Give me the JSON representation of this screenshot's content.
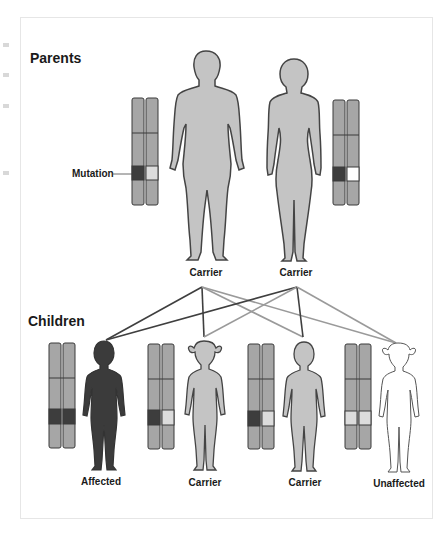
{
  "figure": {
    "sections": {
      "parents": "Parents",
      "children": "Children"
    },
    "mutation_label": "Mutation",
    "parents": [
      {
        "label": "Carrier",
        "sex": "male",
        "status": "carrier"
      },
      {
        "label": "Carrier",
        "sex": "female",
        "status": "carrier"
      }
    ],
    "children": [
      {
        "label": "Affected",
        "sex": "male",
        "status": "affected",
        "alleles": [
          "mutant",
          "mutant"
        ]
      },
      {
        "label": "Carrier",
        "sex": "female",
        "status": "carrier",
        "alleles": [
          "mutant",
          "normal"
        ]
      },
      {
        "label": "Carrier",
        "sex": "male",
        "status": "carrier",
        "alleles": [
          "mutant",
          "normal"
        ]
      },
      {
        "label": "Unaffected",
        "sex": "female",
        "status": "unaffected",
        "alleles": [
          "normal",
          "normal"
        ]
      }
    ],
    "colors": {
      "chromosome": "#a6a6a6",
      "chromosome_border": "#3a3a3a",
      "mutant_band": "#3d3d3d",
      "normal_band": "#dcdcdc",
      "carrier_body": "#c4c4c4",
      "affected_body": "#3b3b3b",
      "unaffected_body": "#ffffff",
      "outline": "#444444",
      "line_dark": "#3f3f3f",
      "line_light": "#9a9a9a"
    }
  }
}
